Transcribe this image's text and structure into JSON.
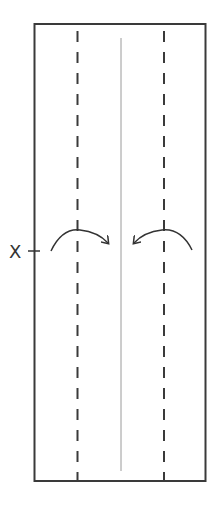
{
  "diagram": {
    "type": "origami-fold-step",
    "marker_label": "X",
    "colors": {
      "outline": "#3a3a3a",
      "fold_line": "#3a3a3a",
      "crease": "#9a9a9a",
      "arrow": "#333333"
    },
    "elements": {
      "paper": "rectangular paper strip",
      "valley_folds": [
        "left valley fold (dashed)",
        "right valley fold (dashed)"
      ],
      "center_crease": "vertical center crease",
      "arrows": [
        "fold left edge to center",
        "fold right edge to center"
      ],
      "marker": "reference point X on left edge"
    }
  }
}
